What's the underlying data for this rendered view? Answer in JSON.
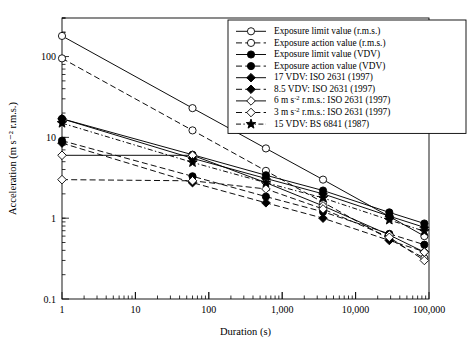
{
  "chart_data": {
    "type": "line",
    "title": "",
    "xlabel": "Duration (s)",
    "ylabel": "Acceleration (m s⁻² r.m.s.)",
    "xscale": "log",
    "yscale": "log",
    "xlim": [
      1,
      100000
    ],
    "ylim": [
      0.1,
      300
    ],
    "grid": false,
    "xticks": [
      1,
      10,
      100,
      1000,
      10000,
      100000
    ],
    "xticklabels": [
      "1",
      "10",
      "100",
      "1,000",
      "10,000",
      "100,000"
    ],
    "yticks": [
      0.1,
      1,
      10,
      100
    ],
    "yticklabels": [
      "0.1",
      "1",
      "10",
      "100"
    ],
    "legend_position": "upper right",
    "x": [
      1,
      60,
      600,
      3600,
      28800,
      86400
    ],
    "series": [
      {
        "name": "Exposure limit value (r.m.s.)",
        "marker": "open-circle",
        "linestyle": "solid",
        "values": [
          180,
          23,
          7.3,
          3.0,
          1.05,
          0.6
        ]
      },
      {
        "name": "Exposure action value (r.m.s.)",
        "marker": "open-circle",
        "linestyle": "dashed",
        "values": [
          95,
          12.2,
          3.85,
          1.57,
          0.55,
          0.32
        ]
      },
      {
        "name": "Exposure limit value (VDV)",
        "marker": "filled-circle",
        "linestyle": "solid",
        "values": [
          17.0,
          6.1,
          3.4,
          2.2,
          1.18,
          0.86
        ]
      },
      {
        "name": "Exposure action value (VDV)",
        "marker": "filled-circle",
        "linestyle": "dashed",
        "values": [
          9.1,
          3.3,
          1.85,
          1.2,
          0.64,
          0.47
        ]
      },
      {
        "name": "17 VDV: ISO 2631 (1997)",
        "marker": "filled-diamond",
        "linestyle": "solid",
        "values": [
          17.0,
          5.5,
          3.1,
          2.0,
          1.06,
          0.77
        ]
      },
      {
        "name": "8.5 VDV: ISO 2631 (1997)",
        "marker": "filled-diamond",
        "linestyle": "dashed",
        "values": [
          8.5,
          2.75,
          1.55,
          1.0,
          0.53,
          0.385
        ]
      },
      {
        "name": "6 m s⁻² r.m.s.: ISO 2631 (1997)",
        "marker": "open-diamond",
        "linestyle": "solid",
        "values": [
          6.0,
          6.0,
          2.75,
          1.42,
          0.62,
          0.38
        ]
      },
      {
        "name": "3 m s⁻² r.m.s.: ISO 2631 (1997)",
        "marker": "open-diamond",
        "linestyle": "dashed",
        "values": [
          3.0,
          2.9,
          2.3,
          1.3,
          0.58,
          0.3
        ]
      },
      {
        "name": "15 VDV: BS 6841 (1987)",
        "marker": "filled-star",
        "linestyle": "dash-dot",
        "values": [
          15.0,
          4.9,
          2.75,
          1.78,
          0.95,
          0.69
        ]
      }
    ]
  },
  "legend": {
    "items": [
      {
        "label": "Exposure limit value (r.m.s.)",
        "marker": "open-circle",
        "linestyle": "solid"
      },
      {
        "label": "Exposure action value (r.m.s.)",
        "marker": "open-circle",
        "linestyle": "dashed"
      },
      {
        "label": "Exposure limit value (VDV)",
        "marker": "filled-circle",
        "linestyle": "solid"
      },
      {
        "label": "Exposure action value (VDV)",
        "marker": "filled-circle",
        "linestyle": "dashed"
      },
      {
        "label": "17 VDV: ISO 2631 (1997)",
        "marker": "filled-diamond",
        "linestyle": "solid"
      },
      {
        "label": "8.5 VDV: ISO 2631 (1997)",
        "marker": "filled-diamond",
        "linestyle": "dashed"
      },
      {
        "label": "6 m s⁻² r.m.s.: ISO 2631 (1997)",
        "marker": "open-diamond",
        "linestyle": "solid"
      },
      {
        "label": "3 m s⁻² r.m.s.: ISO 2631 (1997)",
        "marker": "open-diamond",
        "linestyle": "dashed"
      },
      {
        "label": "15 VDV: BS 6841 (1987)",
        "marker": "filled-star",
        "linestyle": "dash-dot"
      }
    ]
  },
  "colors": {
    "line": "#000000",
    "axis": "#000000",
    "background": "#ffffff"
  }
}
